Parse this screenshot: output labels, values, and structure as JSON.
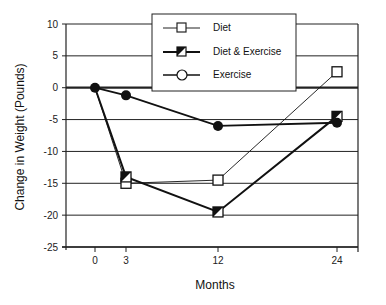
{
  "chart_data": {
    "type": "line",
    "title": "",
    "xlabel": "Months",
    "ylabel": "Change in Weight (Pounds)",
    "x": [
      0,
      3,
      12,
      24
    ],
    "x_ticks": [
      "0",
      "3",
      "12",
      "24"
    ],
    "y_ticks": [
      "10",
      "5",
      "0",
      "-5",
      "-10",
      "-15",
      "-20",
      "-25"
    ],
    "ylim": [
      -25,
      10
    ],
    "grid": true,
    "legend_position": "top-center",
    "series": [
      {
        "name": "Diet",
        "marker": "open-square",
        "values": [
          0,
          -15,
          -14.5,
          2.5
        ]
      },
      {
        "name": "Diet & Exercise",
        "marker": "half-filled-square",
        "values": [
          0,
          -14,
          -19.5,
          -4.5
        ]
      },
      {
        "name": "Exercise",
        "marker": "filled-circle",
        "values": [
          0,
          -1.2,
          -6,
          -5.5
        ]
      }
    ]
  },
  "legend": {
    "items": [
      {
        "label": "Diet"
      },
      {
        "label": "Diet & Exercise"
      },
      {
        "label": "Exercise"
      }
    ]
  }
}
